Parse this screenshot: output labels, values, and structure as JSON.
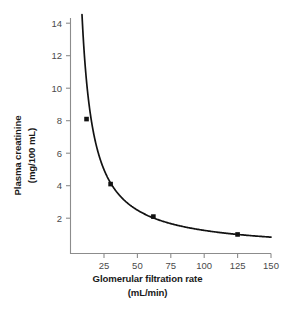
{
  "chart_data": {
    "type": "line",
    "title": "",
    "subtitle": "",
    "xlabel": "Glomerular filtration rate",
    "xunit": "(mL/min)",
    "ylabel": "Plasma creatinine",
    "yunit": "(mg/100 mL)",
    "xlim": [
      0,
      150
    ],
    "ylim": [
      0,
      14.9
    ],
    "xticks": [
      25,
      50,
      75,
      100,
      125,
      150
    ],
    "yticks": [
      2,
      4,
      6,
      8,
      10,
      12,
      14
    ],
    "xtick_labels": [
      "25",
      "50",
      "75",
      "100",
      "125",
      "150"
    ],
    "ytick_labels": [
      "2",
      "4",
      "6",
      "8",
      "10",
      "12",
      "14"
    ],
    "grid": false,
    "legend": "none",
    "relationship": "plasma creatinine is inversely proportional to GFR (hyperbola, approx. creatinine = 125 / GFR)",
    "curve_constant": 125,
    "curve_x_start": 8.6,
    "curve_x_end": 150,
    "series": [
      {
        "name": "Plasma creatinine vs GFR",
        "color": "#121212",
        "x": [
          12,
          30,
          62,
          125
        ],
        "y": [
          8.1,
          4.1,
          2.1,
          1.0
        ],
        "marker": "square"
      }
    ],
    "annotations": []
  },
  "axis": {
    "x_title": "Glomerular filtration rate",
    "x_unit": "(mL/min)",
    "y_title": "Plasma creatinine",
    "y_unit": "(mg/100 mL)"
  },
  "colors": {
    "curve": "#121212",
    "marker": "#121212",
    "axis": "#8c8c8c",
    "tick_text": "#4a4a4a",
    "title_text": "#1a1a1a",
    "background": "#ffffff"
  }
}
